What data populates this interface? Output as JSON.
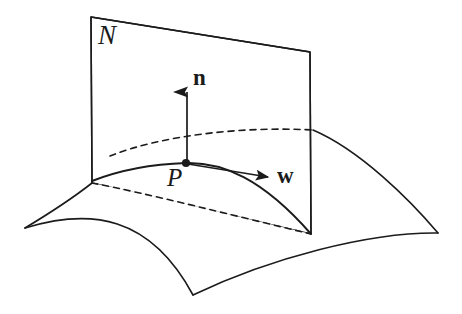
{
  "figure": {
    "caption_title": "Normal plane N, surface point P, normal vector n and tangent vector w",
    "background_color": "#ffffff",
    "stroke_color": "#1b1b1b",
    "labels": {
      "plane": "N",
      "point": "P",
      "normal_vector": "n",
      "tangent_vector": "w"
    },
    "elements": {
      "plane_name": "normal-plane",
      "surface_name": "saddle-surface",
      "point_name": "point-P",
      "normal_arrow_name": "normal-vector-n",
      "tangent_arrow_name": "tangent-vector-w",
      "intersection_curve_name": "normal-section-curve",
      "hidden_ridge_name": "hidden-back-ridge",
      "hidden_back_edge_name": "hidden-back-edge"
    },
    "geometry": {
      "plane_corners": [
        [
          91,
          17
        ],
        [
          310,
          52
        ],
        [
          311,
          234
        ],
        [
          92,
          183
        ]
      ],
      "surface_left_corner": [
        25,
        228
      ],
      "surface_right_corner": [
        438,
        233
      ],
      "surface_front_corner": [
        193,
        295
      ],
      "point_P": [
        186,
        163
      ],
      "normal_tip": [
        187,
        88
      ],
      "tangent_tip": [
        272,
        177
      ],
      "normal_section_path": "M 92 181 C 120 170, 155 164, 186 163 C 222 162, 262 178, 311 234",
      "hidden_ridge_path": "M 110 156 C 160 136, 240 126, 313 130",
      "hidden_back_edge_path": "M 92 183 C 150 194, 235 216, 311 234",
      "surface_back_right_path": "M 313 130 C 360 150, 410 200, 438 233",
      "surface_front_left_path": "M 25 228 C 70 214, 120 226, 193 295",
      "surface_front_right_path": "M 193 295 C 270 258, 370 232, 438 233",
      "surface_left_edge_path": "M 25 228 C 55 210, 78 194, 92 183",
      "surface_mid_front_path": "M 25 228 C 90 208, 150 215, 193 295"
    }
  }
}
